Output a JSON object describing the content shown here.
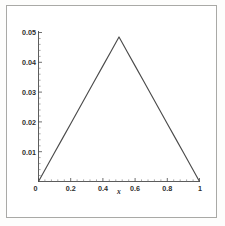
{
  "figure": {
    "background_color": "#ffffff",
    "frame_color": "#a9a9a6",
    "line_color": "#4b4b4b",
    "text_color": "#2e2e2e"
  },
  "chart_data": {
    "type": "line",
    "title": "",
    "subtitle": "",
    "xlabel": "x",
    "ylabel": "",
    "xlim": [
      0,
      1
    ],
    "ylim": [
      0,
      0.05
    ],
    "grid": false,
    "legend": null,
    "legend_position": "none",
    "x_ticks": [
      0,
      0.2,
      0.4,
      0.6,
      0.8,
      1
    ],
    "x_tick_labels": [
      "0",
      "0.2",
      "0.4",
      "0.6",
      "0.8",
      "1"
    ],
    "y_ticks": [
      0.01,
      0.02,
      0.03,
      0.04,
      0.05
    ],
    "y_tick_labels": [
      "0.01",
      "0.02",
      "0.03",
      "0.04",
      "0.05"
    ],
    "minor_ticks": true,
    "annotations": [],
    "series": [
      {
        "name": "tent function",
        "color": "#4b4b4b",
        "peak_x": 0.5,
        "peak_y": 0.0485,
        "x": [
          0.0,
          0.05,
          0.1,
          0.15,
          0.2,
          0.25,
          0.3,
          0.35,
          0.4,
          0.45,
          0.48,
          0.5,
          0.52,
          0.55,
          0.6,
          0.65,
          0.7,
          0.75,
          0.8,
          0.85,
          0.9,
          0.95,
          1.0
        ],
        "y": [
          0.0,
          0.00485,
          0.0097,
          0.01455,
          0.0194,
          0.02425,
          0.0291,
          0.03395,
          0.0388,
          0.04365,
          0.04655,
          0.0485,
          0.04655,
          0.04365,
          0.0388,
          0.03395,
          0.0291,
          0.02425,
          0.0194,
          0.01455,
          0.0097,
          0.00485,
          0.0
        ]
      }
    ]
  },
  "axis_labels": {
    "y5": "0.05",
    "y4": "0.04",
    "y3": "0.03",
    "y2": "0.02",
    "y1": "0.01",
    "x0": "0",
    "x02": "0.2",
    "x04": "0.4",
    "x06": "0.6",
    "x08": "0.8",
    "x1": "1",
    "x_axis_title": "x"
  }
}
